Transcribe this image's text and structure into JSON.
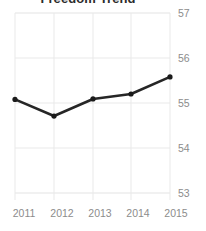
{
  "chart_data": {
    "type": "line",
    "title": "Freedom Trend",
    "xlabel": "",
    "ylabel": "",
    "categories": [
      "2011",
      "2012",
      "2013",
      "2014",
      "2015"
    ],
    "x": [
      2011,
      2012,
      2013,
      2014,
      2015
    ],
    "values": [
      55.08,
      54.71,
      55.09,
      55.2,
      55.58
    ],
    "series": [
      {
        "name": "Freedom score",
        "values": [
          55.08,
          54.71,
          55.09,
          55.2,
          55.58
        ]
      }
    ],
    "ylim": [
      53,
      57
    ],
    "yticks": [
      "57",
      "56",
      "55",
      "54",
      "53"
    ],
    "ytick_values": [
      57,
      56,
      55,
      54,
      53
    ],
    "xticks": [
      "2011",
      "2012",
      "2013",
      "2014",
      "2015"
    ],
    "grid": true,
    "legend": false,
    "legend_position": "none",
    "marker": "circle",
    "colors": {
      "line": "#262626",
      "marker": "#1a1a1a",
      "grid": "#e3e3e3",
      "tick_label": "#8c8c8c",
      "title": "#2b2b2b",
      "background": "#ffffff"
    }
  }
}
